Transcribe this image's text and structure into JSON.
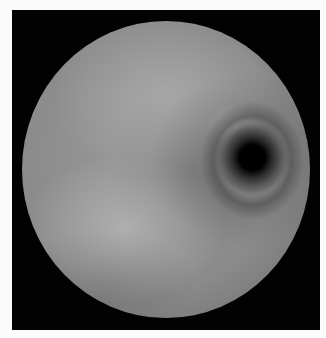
{
  "image": {
    "description": "Grayscale endoscopic view inside a circular field on a black square frame",
    "colors": {
      "page_background": "#fbfbfb",
      "frame": "#020202",
      "tissue": "#8c8c8c",
      "lumen": "#000000"
    }
  }
}
